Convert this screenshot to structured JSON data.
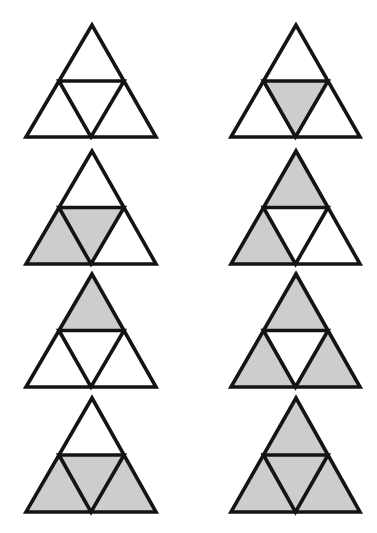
{
  "figure": {
    "colors": {
      "stroke": "#141414",
      "shaded": "#cdcdcd",
      "unshaded": "#ffffff",
      "background": "#ffffff"
    },
    "columns": [
      {
        "left": 26,
        "apex": 92,
        "right": 156
      },
      {
        "left": 231,
        "apex": 296,
        "right": 360
      }
    ],
    "rows": [
      {
        "top": 25,
        "bottom": 137
      },
      {
        "top": 151,
        "bottom": 264
      },
      {
        "top": 274,
        "bottom": 387
      },
      {
        "top": 398,
        "bottom": 512
      }
    ],
    "triangles": [
      {
        "id": 1,
        "row": 0,
        "col": 0,
        "shaded": {
          "top": false,
          "left": false,
          "middle": false,
          "right": false
        }
      },
      {
        "id": 2,
        "row": 0,
        "col": 1,
        "shaded": {
          "top": false,
          "left": false,
          "middle": true,
          "right": false
        }
      },
      {
        "id": 3,
        "row": 1,
        "col": 0,
        "shaded": {
          "top": false,
          "left": true,
          "middle": true,
          "right": false
        }
      },
      {
        "id": 4,
        "row": 1,
        "col": 1,
        "shaded": {
          "top": true,
          "left": true,
          "middle": false,
          "right": false
        }
      },
      {
        "id": 5,
        "row": 2,
        "col": 0,
        "shaded": {
          "top": true,
          "left": false,
          "middle": false,
          "right": false
        }
      },
      {
        "id": 6,
        "row": 2,
        "col": 1,
        "shaded": {
          "top": true,
          "left": true,
          "middle": false,
          "right": true
        }
      },
      {
        "id": 7,
        "row": 3,
        "col": 0,
        "shaded": {
          "top": false,
          "left": true,
          "middle": true,
          "right": true
        }
      },
      {
        "id": 8,
        "row": 3,
        "col": 1,
        "shaded": {
          "top": true,
          "left": true,
          "middle": true,
          "right": true
        }
      }
    ]
  }
}
